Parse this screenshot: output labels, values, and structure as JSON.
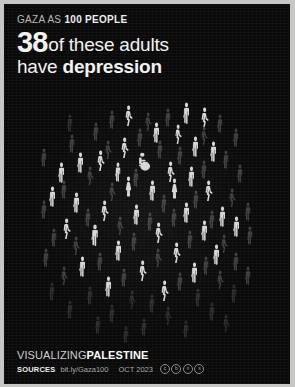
{
  "poster": {
    "background_color": "#090909",
    "frame_color": "#c7c7c5",
    "highlight_color": "#d6d6d4",
    "muted_color": "#3c3c3c"
  },
  "header": {
    "kicker_prefix": "GAZA AS ",
    "kicker_bold": "100 PEOPLE",
    "big_number": "38",
    "headline_line1": "of these adults",
    "headline_line2_prefix": "have ",
    "headline_line2_bold": "depression"
  },
  "footer": {
    "brand_light": "VISUALIZING",
    "brand_bold": "PALESTINE",
    "sources_label": "SOURCES",
    "sources_url": "bit.ly/Gaza100",
    "date": "OCT 2023",
    "license_badges": [
      "cc",
      "by",
      "nc",
      "sa"
    ]
  },
  "chart_data": {
    "type": "pictogram",
    "unit": "1 icon = 1 person",
    "total": 100,
    "categories": [
      "has depression",
      "does not have depression"
    ],
    "values": [
      38,
      62
    ],
    "highlighted": 38,
    "muted": 62,
    "legend_position": "none",
    "grid": false,
    "icons": [
      {
        "x": 120,
        "y": 101,
        "w": 9,
        "h": 21,
        "state": "on",
        "pose": "walk"
      },
      {
        "x": 178,
        "y": 98,
        "w": 9,
        "h": 22,
        "state": "on",
        "pose": "stand"
      },
      {
        "x": 196,
        "y": 103,
        "w": 9,
        "h": 21,
        "state": "on",
        "pose": "walk"
      },
      {
        "x": 148,
        "y": 118,
        "w": 9,
        "h": 21,
        "state": "on",
        "pose": "stand"
      },
      {
        "x": 170,
        "y": 120,
        "w": 8,
        "h": 20,
        "state": "on",
        "pose": "walk"
      },
      {
        "x": 116,
        "y": 133,
        "w": 9,
        "h": 21,
        "state": "on",
        "pose": "walk"
      },
      {
        "x": 187,
        "y": 132,
        "w": 9,
        "h": 21,
        "state": "on",
        "pose": "stand"
      },
      {
        "x": 205,
        "y": 137,
        "w": 9,
        "h": 21,
        "state": "on",
        "pose": "stand"
      },
      {
        "x": 72,
        "y": 148,
        "w": 9,
        "h": 21,
        "state": "on",
        "pose": "stand"
      },
      {
        "x": 92,
        "y": 146,
        "w": 9,
        "h": 21,
        "state": "on",
        "pose": "walk"
      },
      {
        "x": 133,
        "y": 148,
        "w": 14,
        "h": 19,
        "state": "on",
        "pose": "chair"
      },
      {
        "x": 53,
        "y": 158,
        "w": 9,
        "h": 21,
        "state": "on",
        "pose": "stand"
      },
      {
        "x": 110,
        "y": 158,
        "w": 8,
        "h": 20,
        "state": "on",
        "pose": "stand"
      },
      {
        "x": 162,
        "y": 157,
        "w": 9,
        "h": 21,
        "state": "on",
        "pose": "walk"
      },
      {
        "x": 183,
        "y": 162,
        "w": 9,
        "h": 21,
        "state": "on",
        "pose": "stand"
      },
      {
        "x": 120,
        "y": 172,
        "w": 9,
        "h": 21,
        "state": "on",
        "pose": "dress"
      },
      {
        "x": 144,
        "y": 176,
        "w": 9,
        "h": 21,
        "state": "on",
        "pose": "stand"
      },
      {
        "x": 166,
        "y": 174,
        "w": 9,
        "h": 21,
        "state": "on",
        "pose": "dress"
      },
      {
        "x": 200,
        "y": 176,
        "w": 9,
        "h": 21,
        "state": "on",
        "pose": "walk"
      },
      {
        "x": 44,
        "y": 182,
        "w": 9,
        "h": 21,
        "state": "on",
        "pose": "stand"
      },
      {
        "x": 68,
        "y": 188,
        "w": 9,
        "h": 21,
        "state": "on",
        "pose": "stand"
      },
      {
        "x": 96,
        "y": 196,
        "w": 9,
        "h": 21,
        "state": "on",
        "pose": "walk"
      },
      {
        "x": 128,
        "y": 200,
        "w": 9,
        "h": 21,
        "state": "on",
        "pose": "stand"
      },
      {
        "x": 178,
        "y": 198,
        "w": 9,
        "h": 21,
        "state": "on",
        "pose": "stand"
      },
      {
        "x": 214,
        "y": 202,
        "w": 9,
        "h": 21,
        "state": "on",
        "pose": "stand"
      },
      {
        "x": 58,
        "y": 214,
        "w": 9,
        "h": 21,
        "state": "on",
        "pose": "walk"
      },
      {
        "x": 86,
        "y": 220,
        "w": 10,
        "h": 22,
        "state": "on",
        "pose": "stand"
      },
      {
        "x": 150,
        "y": 218,
        "w": 9,
        "h": 21,
        "state": "on",
        "pose": "walk"
      },
      {
        "x": 196,
        "y": 216,
        "w": 9,
        "h": 21,
        "state": "on",
        "pose": "stand"
      },
      {
        "x": 228,
        "y": 212,
        "w": 9,
        "h": 21,
        "state": "on",
        "pose": "stand"
      },
      {
        "x": 110,
        "y": 236,
        "w": 9,
        "h": 21,
        "state": "on",
        "pose": "stand"
      },
      {
        "x": 168,
        "y": 238,
        "w": 9,
        "h": 21,
        "state": "on",
        "pose": "walk"
      },
      {
        "x": 208,
        "y": 240,
        "w": 9,
        "h": 21,
        "state": "on",
        "pose": "stand"
      },
      {
        "x": 74,
        "y": 252,
        "w": 9,
        "h": 21,
        "state": "on",
        "pose": "stand"
      },
      {
        "x": 134,
        "y": 256,
        "w": 9,
        "h": 21,
        "state": "on",
        "pose": "walk"
      },
      {
        "x": 186,
        "y": 258,
        "w": 9,
        "h": 21,
        "state": "on",
        "pose": "stand"
      },
      {
        "x": 100,
        "y": 272,
        "w": 9,
        "h": 21,
        "state": "on",
        "pose": "stand"
      },
      {
        "x": 156,
        "y": 276,
        "w": 9,
        "h": 21,
        "state": "on",
        "pose": "walk"
      },
      {
        "x": 104,
        "y": 106,
        "w": 8,
        "h": 19,
        "state": "off",
        "pose": "stand"
      },
      {
        "x": 140,
        "y": 108,
        "w": 8,
        "h": 19,
        "state": "off",
        "pose": "walk"
      },
      {
        "x": 160,
        "y": 104,
        "w": 8,
        "h": 19,
        "state": "off",
        "pose": "stand"
      },
      {
        "x": 212,
        "y": 110,
        "w": 8,
        "h": 19,
        "state": "off",
        "pose": "stand"
      },
      {
        "x": 88,
        "y": 118,
        "w": 8,
        "h": 19,
        "state": "off",
        "pose": "stand"
      },
      {
        "x": 132,
        "y": 124,
        "w": 8,
        "h": 19,
        "state": "off",
        "pose": "stand"
      },
      {
        "x": 196,
        "y": 122,
        "w": 8,
        "h": 19,
        "state": "off",
        "pose": "walk"
      },
      {
        "x": 228,
        "y": 124,
        "w": 8,
        "h": 19,
        "state": "off",
        "pose": "stand"
      },
      {
        "x": 64,
        "y": 130,
        "w": 8,
        "h": 19,
        "state": "off",
        "pose": "stand"
      },
      {
        "x": 100,
        "y": 136,
        "w": 8,
        "h": 19,
        "state": "off",
        "pose": "walk"
      },
      {
        "x": 152,
        "y": 136,
        "w": 8,
        "h": 19,
        "state": "off",
        "pose": "stand"
      },
      {
        "x": 172,
        "y": 142,
        "w": 8,
        "h": 19,
        "state": "off",
        "pose": "stand"
      },
      {
        "x": 218,
        "y": 146,
        "w": 8,
        "h": 19,
        "state": "off",
        "pose": "stand"
      },
      {
        "x": 36,
        "y": 144,
        "w": 8,
        "h": 19,
        "state": "off",
        "pose": "stand"
      },
      {
        "x": 82,
        "y": 162,
        "w": 8,
        "h": 19,
        "state": "off",
        "pose": "walk"
      },
      {
        "x": 128,
        "y": 164,
        "w": 8,
        "h": 19,
        "state": "off",
        "pose": "stand"
      },
      {
        "x": 196,
        "y": 156,
        "w": 8,
        "h": 19,
        "state": "off",
        "pose": "stand"
      },
      {
        "x": 232,
        "y": 160,
        "w": 8,
        "h": 19,
        "state": "off",
        "pose": "stand"
      },
      {
        "x": 56,
        "y": 176,
        "w": 8,
        "h": 19,
        "state": "off",
        "pose": "stand"
      },
      {
        "x": 104,
        "y": 178,
        "w": 8,
        "h": 19,
        "state": "off",
        "pose": "walk"
      },
      {
        "x": 156,
        "y": 190,
        "w": 8,
        "h": 19,
        "state": "off",
        "pose": "stand"
      },
      {
        "x": 188,
        "y": 186,
        "w": 8,
        "h": 19,
        "state": "off",
        "pose": "stand"
      },
      {
        "x": 224,
        "y": 184,
        "w": 8,
        "h": 19,
        "state": "off",
        "pose": "walk"
      },
      {
        "x": 36,
        "y": 196,
        "w": 8,
        "h": 19,
        "state": "off",
        "pose": "stand"
      },
      {
        "x": 80,
        "y": 204,
        "w": 8,
        "h": 19,
        "state": "off",
        "pose": "stand"
      },
      {
        "x": 112,
        "y": 212,
        "w": 8,
        "h": 19,
        "state": "off",
        "pose": "walk"
      },
      {
        "x": 142,
        "y": 208,
        "w": 8,
        "h": 19,
        "state": "off",
        "pose": "stand"
      },
      {
        "x": 166,
        "y": 204,
        "w": 8,
        "h": 19,
        "state": "off",
        "pose": "stand"
      },
      {
        "x": 204,
        "y": 206,
        "w": 8,
        "h": 19,
        "state": "off",
        "pose": "stand"
      },
      {
        "x": 240,
        "y": 198,
        "w": 8,
        "h": 19,
        "state": "off",
        "pose": "stand"
      },
      {
        "x": 46,
        "y": 224,
        "w": 8,
        "h": 19,
        "state": "off",
        "pose": "stand"
      },
      {
        "x": 68,
        "y": 232,
        "w": 8,
        "h": 19,
        "state": "off",
        "pose": "walk"
      },
      {
        "x": 126,
        "y": 228,
        "w": 8,
        "h": 19,
        "state": "off",
        "pose": "stand"
      },
      {
        "x": 182,
        "y": 226,
        "w": 8,
        "h": 19,
        "state": "off",
        "pose": "stand"
      },
      {
        "x": 216,
        "y": 230,
        "w": 8,
        "h": 19,
        "state": "off",
        "pose": "walk"
      },
      {
        "x": 242,
        "y": 222,
        "w": 8,
        "h": 19,
        "state": "off",
        "pose": "stand"
      },
      {
        "x": 38,
        "y": 244,
        "w": 8,
        "h": 19,
        "state": "off",
        "pose": "stand"
      },
      {
        "x": 92,
        "y": 248,
        "w": 8,
        "h": 19,
        "state": "off",
        "pose": "stand"
      },
      {
        "x": 150,
        "y": 244,
        "w": 8,
        "h": 19,
        "state": "off",
        "pose": "walk"
      },
      {
        "x": 198,
        "y": 252,
        "w": 8,
        "h": 19,
        "state": "off",
        "pose": "stand"
      },
      {
        "x": 228,
        "y": 248,
        "w": 8,
        "h": 19,
        "state": "off",
        "pose": "stand"
      },
      {
        "x": 56,
        "y": 262,
        "w": 8,
        "h": 19,
        "state": "off",
        "pose": "walk"
      },
      {
        "x": 116,
        "y": 264,
        "w": 8,
        "h": 19,
        "state": "off",
        "pose": "stand"
      },
      {
        "x": 172,
        "y": 268,
        "w": 8,
        "h": 19,
        "state": "off",
        "pose": "stand"
      },
      {
        "x": 212,
        "y": 266,
        "w": 8,
        "h": 19,
        "state": "off",
        "pose": "walk"
      },
      {
        "x": 240,
        "y": 262,
        "w": 8,
        "h": 19,
        "state": "off",
        "pose": "stand"
      },
      {
        "x": 44,
        "y": 278,
        "w": 8,
        "h": 19,
        "state": "dim",
        "pose": "stand"
      },
      {
        "x": 82,
        "y": 282,
        "w": 8,
        "h": 19,
        "state": "dim",
        "pose": "stand"
      },
      {
        "x": 124,
        "y": 286,
        "w": 8,
        "h": 19,
        "state": "dim",
        "pose": "walk"
      },
      {
        "x": 144,
        "y": 290,
        "w": 8,
        "h": 19,
        "state": "dim",
        "pose": "stand"
      },
      {
        "x": 190,
        "y": 284,
        "w": 8,
        "h": 19,
        "state": "dim",
        "pose": "stand"
      },
      {
        "x": 226,
        "y": 280,
        "w": 8,
        "h": 19,
        "state": "dim",
        "pose": "stand"
      },
      {
        "x": 62,
        "y": 296,
        "w": 8,
        "h": 19,
        "state": "dim",
        "pose": "stand"
      },
      {
        "x": 104,
        "y": 300,
        "w": 8,
        "h": 19,
        "state": "dim",
        "pose": "stand"
      },
      {
        "x": 160,
        "y": 302,
        "w": 8,
        "h": 19,
        "state": "dim",
        "pose": "walk"
      },
      {
        "x": 204,
        "y": 298,
        "w": 8,
        "h": 19,
        "state": "dim",
        "pose": "stand"
      },
      {
        "x": 90,
        "y": 312,
        "w": 8,
        "h": 18,
        "state": "dim",
        "pose": "stand"
      },
      {
        "x": 136,
        "y": 314,
        "w": 8,
        "h": 18,
        "state": "dim",
        "pose": "stand"
      },
      {
        "x": 178,
        "y": 316,
        "w": 8,
        "h": 18,
        "state": "dim",
        "pose": "stand"
      },
      {
        "x": 218,
        "y": 310,
        "w": 8,
        "h": 18,
        "state": "dim",
        "pose": "walk"
      },
      {
        "x": 118,
        "y": 322,
        "w": 8,
        "h": 17,
        "state": "dim",
        "pose": "stand"
      },
      {
        "x": 62,
        "y": 110,
        "w": 8,
        "h": 18,
        "state": "dim",
        "pose": "stand"
      }
    ]
  }
}
